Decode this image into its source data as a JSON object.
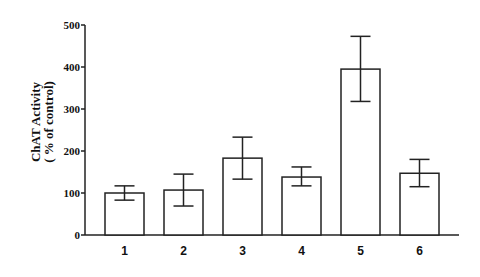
{
  "chart_data": {
    "type": "bar",
    "title": "",
    "xlabel": "",
    "ylabel": "ChAT Activity",
    "ylabel_line2": "( % of control)",
    "categories": [
      "1",
      "2",
      "3",
      "4",
      "5",
      "6"
    ],
    "values": [
      100,
      107,
      183,
      138,
      395,
      147
    ],
    "error_upper": [
      117,
      145,
      233,
      162,
      473,
      180
    ],
    "error_lower": [
      83,
      69,
      133,
      117,
      318,
      115
    ],
    "ylim": [
      0,
      500
    ],
    "yticks": [
      0,
      100,
      200,
      300,
      400,
      500
    ],
    "grid": false,
    "legend": null,
    "bar_fill": "#ffffff",
    "bar_stroke": "#222222"
  }
}
